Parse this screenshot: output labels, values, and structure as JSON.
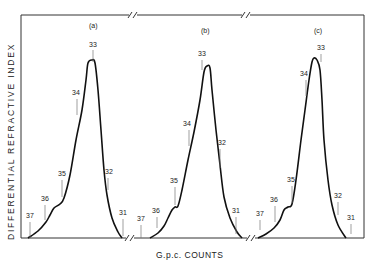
{
  "chart_data": {
    "type": "line",
    "title": "",
    "xlabel": "G.p.c.  COUNTS",
    "ylabel": "DIFFERENTIAL  REFRACTIVE  INDEX",
    "grid": false,
    "legend": null,
    "panels": [
      {
        "label": "(a)",
        "count_markers": [
          "37",
          "36",
          "35",
          "34",
          "33",
          "32",
          "31"
        ],
        "curve": [
          [
            28,
            238
          ],
          [
            38,
            231
          ],
          [
            46,
            222
          ],
          [
            50,
            215
          ],
          [
            54,
            208
          ],
          [
            60,
            204
          ],
          [
            64,
            198
          ],
          [
            70,
            175
          ],
          [
            76,
            140
          ],
          [
            82,
            110
          ],
          [
            86,
            80
          ],
          [
            88,
            63
          ],
          [
            92,
            60
          ],
          [
            95,
            63
          ],
          [
            98,
            90
          ],
          [
            101,
            130
          ],
          [
            104,
            170
          ],
          [
            107,
            195
          ],
          [
            112,
            218
          ],
          [
            118,
            232
          ],
          [
            122,
            238
          ]
        ],
        "markers": [
          {
            "label": "37",
            "lx": 30,
            "ly": 218,
            "x": 30,
            "y1": 222,
            "y2": 238
          },
          {
            "label": "36",
            "lx": 45,
            "ly": 201,
            "x": 45,
            "y1": 205,
            "y2": 220
          },
          {
            "label": "35",
            "lx": 62,
            "ly": 176,
            "x": 62,
            "y1": 180,
            "y2": 197
          },
          {
            "label": "34",
            "lx": 76,
            "ly": 95,
            "x": 77,
            "y1": 99,
            "y2": 115
          },
          {
            "label": "33",
            "lx": 93,
            "ly": 47,
            "x": 93,
            "y1": 50,
            "y2": 62
          },
          {
            "label": "32",
            "lx": 109,
            "ly": 174,
            "x": 108,
            "y1": 178,
            "y2": 190
          },
          {
            "label": "31",
            "lx": 123,
            "ly": 215,
            "x": 123,
            "y1": 219,
            "y2": 236
          }
        ]
      },
      {
        "label": "(b)",
        "count_markers": [
          "37",
          "36",
          "35",
          "34",
          "33",
          "32",
          "31"
        ],
        "curve": [
          [
            150,
            238
          ],
          [
            158,
            233
          ],
          [
            164,
            226
          ],
          [
            168,
            218
          ],
          [
            172,
            210
          ],
          [
            175,
            207
          ],
          [
            178,
            206
          ],
          [
            182,
            190
          ],
          [
            188,
            160
          ],
          [
            194,
            132
          ],
          [
            200,
            100
          ],
          [
            204,
            72
          ],
          [
            207,
            66
          ],
          [
            210,
            68
          ],
          [
            212,
            90
          ],
          [
            216,
            130
          ],
          [
            220,
            165
          ],
          [
            224,
            197
          ],
          [
            230,
            218
          ],
          [
            237,
            232
          ],
          [
            242,
            238
          ]
        ],
        "markers": [
          {
            "label": "37",
            "lx": 141,
            "ly": 221,
            "x": 141,
            "y1": 225,
            "y2": 238
          },
          {
            "label": "36",
            "lx": 156,
            "ly": 213,
            "x": 157,
            "y1": 217,
            "y2": 228
          },
          {
            "label": "35",
            "lx": 174,
            "ly": 183,
            "x": 175,
            "y1": 187,
            "y2": 205
          },
          {
            "label": "34",
            "lx": 187,
            "ly": 126,
            "x": 189,
            "y1": 130,
            "y2": 146
          },
          {
            "label": "33",
            "lx": 202,
            "ly": 56,
            "x": 202,
            "y1": 60,
            "y2": 70
          },
          {
            "label": "32",
            "lx": 222,
            "ly": 145,
            "x": 220,
            "y1": 149,
            "y2": 168
          },
          {
            "label": "31",
            "lx": 236,
            "ly": 213,
            "x": 236,
            "y1": 217,
            "y2": 234
          }
        ]
      },
      {
        "label": "(c)",
        "count_markers": [
          "37",
          "36",
          "35",
          "34",
          "33",
          "32",
          "31"
        ],
        "curve": [
          [
            258,
            238
          ],
          [
            266,
            234
          ],
          [
            274,
            228
          ],
          [
            280,
            220
          ],
          [
            284,
            210
          ],
          [
            288,
            207
          ],
          [
            292,
            204
          ],
          [
            296,
            180
          ],
          [
            301,
            140
          ],
          [
            305,
            110
          ],
          [
            309,
            80
          ],
          [
            312,
            62
          ],
          [
            314,
            58
          ],
          [
            317,
            60
          ],
          [
            320,
            70
          ],
          [
            322,
            100
          ],
          [
            324,
            140
          ],
          [
            328,
            180
          ],
          [
            332,
            205
          ],
          [
            338,
            225
          ],
          [
            346,
            238
          ]
        ],
        "markers": [
          {
            "label": "37",
            "lx": 260,
            "ly": 216,
            "x": 260,
            "y1": 220,
            "y2": 230
          },
          {
            "label": "36",
            "lx": 274,
            "ly": 202,
            "x": 275,
            "y1": 206,
            "y2": 222
          },
          {
            "label": "35",
            "lx": 291,
            "ly": 182,
            "x": 292,
            "y1": 186,
            "y2": 203
          },
          {
            "label": "34",
            "lx": 304,
            "ly": 76,
            "x": 306,
            "y1": 80,
            "y2": 96
          },
          {
            "label": "33",
            "lx": 321,
            "ly": 50,
            "x": 321,
            "y1": 54,
            "y2": 62
          },
          {
            "label": "32",
            "lx": 338,
            "ly": 198,
            "x": 338,
            "y1": 202,
            "y2": 215
          },
          {
            "label": "31",
            "lx": 351,
            "ly": 220,
            "x": 351,
            "y1": 224,
            "y2": 234
          }
        ]
      }
    ],
    "axis_breaks": [
      {
        "x": 133,
        "where": "top"
      },
      {
        "x": 246,
        "where": "top"
      },
      {
        "x": 130,
        "where": "bottom"
      },
      {
        "x": 251,
        "where": "bottom"
      }
    ]
  }
}
